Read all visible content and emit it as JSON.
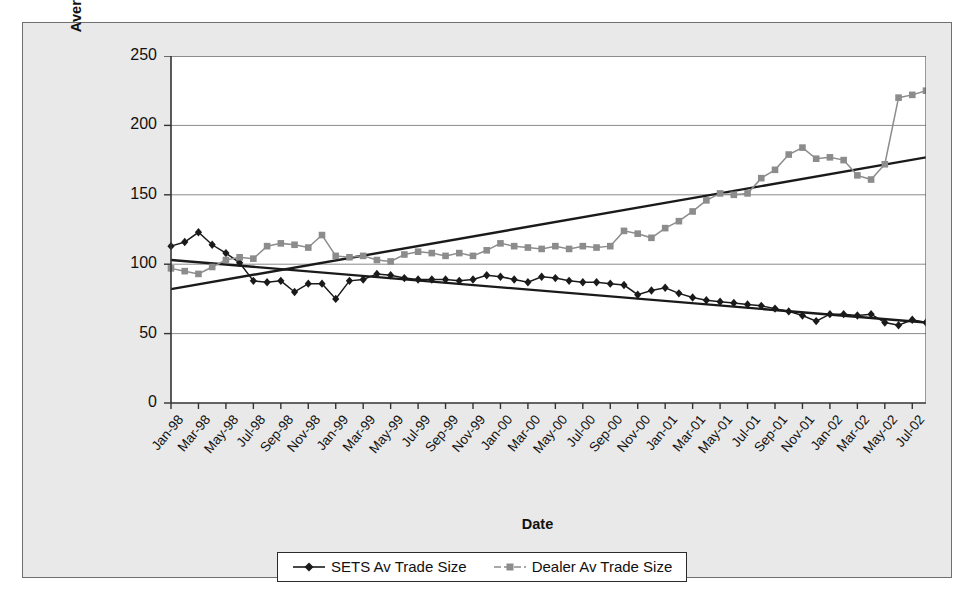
{
  "chart_data": {
    "type": "line",
    "title": "",
    "xlabel": "Date",
    "ylabel": "Average trade size as a percentage of overall average trade size",
    "ylim": [
      0,
      250
    ],
    "yticks": [
      0,
      50,
      100,
      150,
      200,
      250
    ],
    "grid": true,
    "legend_position": "bottom",
    "x": [
      "Jan-98",
      "Feb-98",
      "Mar-98",
      "Apr-98",
      "May-98",
      "Jun-98",
      "Jul-98",
      "Aug-98",
      "Sep-98",
      "Oct-98",
      "Nov-98",
      "Dec-98",
      "Jan-99",
      "Feb-99",
      "Mar-99",
      "Apr-99",
      "May-99",
      "Jun-99",
      "Jul-99",
      "Aug-99",
      "Sep-99",
      "Oct-99",
      "Nov-99",
      "Dec-99",
      "Jan-00",
      "Feb-00",
      "Mar-00",
      "Apr-00",
      "May-00",
      "Jun-00",
      "Jul-00",
      "Aug-00",
      "Sep-00",
      "Oct-00",
      "Nov-00",
      "Dec-00",
      "Jan-01",
      "Feb-01",
      "Mar-01",
      "Apr-01",
      "May-01",
      "Jun-01",
      "Jul-01",
      "Aug-01",
      "Sep-01",
      "Oct-01",
      "Nov-01",
      "Dec-01",
      "Jan-02",
      "Feb-02",
      "Mar-02",
      "Apr-02",
      "May-02",
      "Jun-02",
      "Jul-02",
      "Aug-02"
    ],
    "xtick_labels": [
      "Jan-98",
      "Mar-98",
      "May-98",
      "Jul-98",
      "Sep-98",
      "Nov-98",
      "Jan-99",
      "Mar-99",
      "May-99",
      "Jul-99",
      "Sep-99",
      "Nov-99",
      "Jan-00",
      "Mar-00",
      "May-00",
      "Jul-00",
      "Sep-00",
      "Nov-00",
      "Jan-01",
      "Mar-01",
      "May-01",
      "Jul-01",
      "Sep-01",
      "Nov-01",
      "Jan-02",
      "Mar-02",
      "May-02",
      "Jul-02"
    ],
    "series": [
      {
        "name": "SETS Av Trade Size",
        "color": "#1a1a1a",
        "marker": "diamond",
        "values": [
          113,
          116,
          123,
          114,
          108,
          101,
          88,
          87,
          88,
          80,
          86,
          86,
          75,
          88,
          89,
          93,
          92,
          90,
          89,
          89,
          89,
          88,
          89,
          92,
          91,
          89,
          87,
          91,
          90,
          88,
          87,
          87,
          86,
          85,
          78,
          81,
          83,
          79,
          76,
          74,
          73,
          72,
          71,
          70,
          68,
          66,
          63,
          59,
          64,
          64,
          63,
          64,
          58,
          56,
          60,
          58
        ]
      },
      {
        "name": "Dealer Av Trade Size",
        "color": "#8c8c8c",
        "marker": "square",
        "values": [
          97,
          95,
          93,
          98,
          103,
          105,
          104,
          113,
          115,
          114,
          112,
          121,
          106,
          105,
          106,
          103,
          102,
          107,
          109,
          108,
          106,
          108,
          106,
          110,
          115,
          113,
          112,
          111,
          113,
          111,
          113,
          112,
          113,
          124,
          122,
          119,
          126,
          131,
          138,
          146,
          151,
          150,
          151,
          162,
          168,
          179,
          184,
          176,
          177,
          175,
          164,
          161,
          172,
          220,
          222,
          225
        ]
      }
    ],
    "trendlines": [
      {
        "name": "SETS trend",
        "series_ref": "SETS Av Trade Size",
        "color": "#1a1a1a",
        "start_value": 103,
        "end_value": 58
      },
      {
        "name": "Dealer trend",
        "series_ref": "Dealer Av Trade Size",
        "color": "#1a1a1a",
        "start_value": 82,
        "end_value": 177
      }
    ]
  },
  "legend": {
    "items": [
      {
        "label": "SETS Av Trade Size"
      },
      {
        "label": "Dealer Av Trade Size"
      }
    ]
  }
}
